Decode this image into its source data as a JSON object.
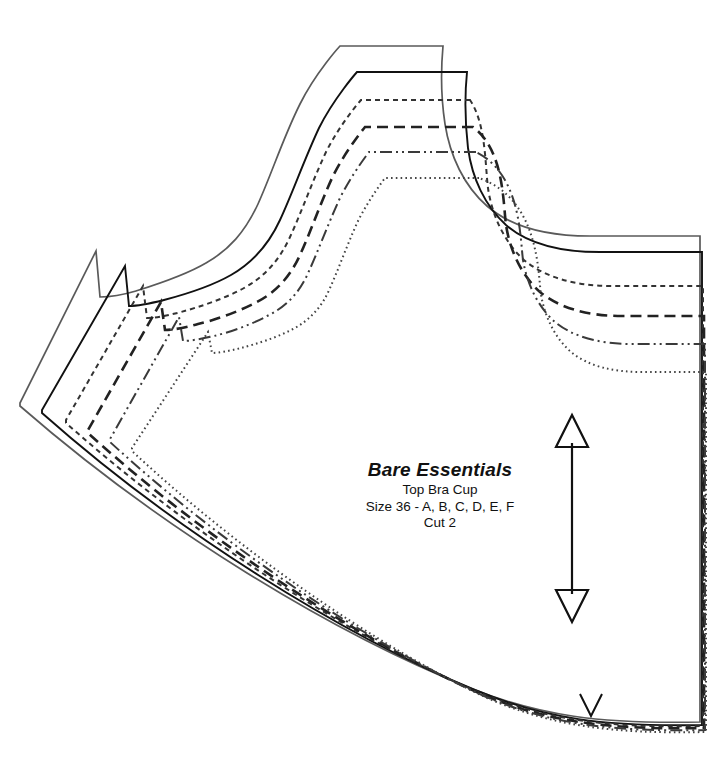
{
  "sheet": {
    "width": 712,
    "height": 759,
    "background": "#ffffff"
  },
  "label": {
    "title": "Bare Essentials",
    "subtitle": "Top Bra Cup",
    "sizes": "Size 36 - A, B, C, D, E, F",
    "cut": "Cut 2"
  },
  "markings": {
    "grainline_name": "grainline-arrow",
    "notch_name": "notch-mark",
    "grainline_color": "#111111",
    "notch_color": "#111111"
  },
  "sizes": [
    {
      "cup": "F",
      "label": "Size 36F",
      "color": "#5a5a5a",
      "stroke_width": 1.7,
      "dash": "none",
      "style_name": "solid-gray",
      "path": "M 443 46 L 340 46 C 340 46 316 72 300 104 C 283 138 272 173 258 204 C 245 232 229 250 206 263 C 184 276 155 285 136 291 C 119 296 107 297 100 297 L 96 251 L 20 403 L 20 406 C 160 528 330 632 470 688 C 540 716 600 724 700 722 L 700 236 L 590 236 C 545 236 510 226 487 206 C 464 186 450 156 445 124 C 441 98 441 68 443 46 Z"
    },
    {
      "cup": "E",
      "label": "Size 36E",
      "color": "#111111",
      "stroke_width": 1.9,
      "dash": "none",
      "style_name": "solid-black",
      "path": "M 467 72 L 357 72 C 357 72 334 98 319 128 C 304 160 293 192 280 220 C 268 246 252 263 231 275 C 210 287 183 295 164 300 C 148 304 136 306 129 306 L 125 266 L 42 410 L 42 413 C 175 531 340 634 475 690 C 545 719 605 727 702 725 L 702 252 L 600 252 C 560 252 527 243 506 225 C 485 206 472 178 468 148 C 465 122 465 92 467 72 Z"
    },
    {
      "cup": "D",
      "label": "Size 36D",
      "color": "#333333",
      "stroke_width": 2.0,
      "dash": "5,4",
      "style_name": "short-dash",
      "path": "M 470 100 L 361 100 C 361 100 340 124 326 152 C 312 182 302 211 290 237 C 279 261 264 277 244 288 C 224 299 199 307 181 312 C 166 316 154 318 147 318 L 143 286 L 66 420 L 66 423 C 192 535 348 636 478 692 C 546 720 606 728 703 726 L 703 286 L 612 286 C 575 286 544 277 524 260 C 505 243 492 216 488 188 C 485 164 486 124 470 100 Z"
    },
    {
      "cup": "C",
      "label": "Size 36C",
      "color": "#222222",
      "stroke_width": 2.6,
      "dash": "11,6",
      "style_name": "long-dash",
      "path": "M 473 127 L 365 127 C 365 127 346 150 333 176 C 320 204 311 231 300 255 C 290 277 276 292 257 302 C 238 312 215 320 198 324 C 184 328 172 330 165 330 L 161 302 L 88 430 L 88 433 C 206 540 355 638 481 694 C 548 722 608 730 704 728 L 704 316 L 622 316 C 588 316 559 308 540 292 C 522 276 510 251 506 225 C 503 202 504 150 473 127 Z"
    },
    {
      "cup": "B",
      "label": "Size 36B",
      "color": "#3a3a3a",
      "stroke_width": 2.0,
      "dash": "12,4,2,4,2,4",
      "style_name": "dash-dot-dot",
      "path": "M 476 152 L 369 152 C 369 152 352 174 340 198 C 328 224 319 249 309 271 C 300 292 287 306 269 315 C 251 325 230 332 214 336 C 201 339 190 341 183 341 L 179 317 L 110 439 L 110 442 C 221 544 362 640 484 696 C 550 724 610 732 705 730 L 705 344 L 632 344 C 600 344 573 337 555 322 C 538 307 527 284 523 260 C 520 238 521 174 476 152 Z"
    },
    {
      "cup": "A",
      "label": "Size 36A",
      "color": "#444444",
      "stroke_width": 2.0,
      "dash": "1.6,3.2",
      "style_name": "fine-dot",
      "path": "M 479 178 L 385 178 C 385 178 369 199 358 221 C 347 245 339 268 330 288 C 322 307 310 320 293 329 C 276 338 256 344 241 348 C 229 351 218 353 212 353 L 208 332 L 132 448 L 132 451 C 236 548 369 642 487 698 C 552 726 612 734 706 732 L 706 372 L 642 372 C 612 372 588 366 571 352 C 555 338 545 317 541 295 C 538 275 540 199 479 178 Z"
    }
  ],
  "grainline": {
    "x": 572,
    "y_top": 415,
    "y_bottom": 622,
    "stroke_width": 2.2,
    "head_half_width": 16,
    "head_length": 32
  },
  "notch": {
    "x": 591,
    "y_top": 694,
    "half_width": 11,
    "depth": 22,
    "stroke_width": 2.0
  }
}
